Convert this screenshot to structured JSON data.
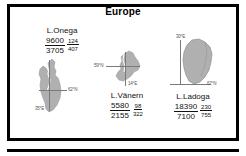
{
  "figure": {
    "title": "Europe",
    "frame_color": "#000000",
    "background": "#ffffff",
    "lake_fill": "#b0b0b0",
    "axis_color": "#7a7a7a"
  },
  "lakes": [
    {
      "id": "onega",
      "name": "L.Onega",
      "stats": {
        "area_numerator": "9600",
        "area_denominator": "3705",
        "depth_numerator": "124",
        "depth_denominator": "407"
      },
      "axis_labels": {
        "horizontal": "62°N",
        "vertical": "35°E"
      }
    },
    {
      "id": "vanern",
      "name": "L.Vänern",
      "stats": {
        "area_numerator": "5580",
        "area_denominator": "2155",
        "depth_numerator": "98",
        "depth_denominator": "322"
      },
      "axis_labels": {
        "horizontal": "59°N",
        "vertical": "14°E"
      }
    },
    {
      "id": "ladoga",
      "name": "L.Ladoga",
      "stats": {
        "area_numerator": "18390",
        "area_denominator": "7100",
        "depth_numerator": "230",
        "depth_denominator": "755"
      },
      "axis_labels": {
        "horizontal": "62°N",
        "vertical": "30°E"
      }
    }
  ]
}
